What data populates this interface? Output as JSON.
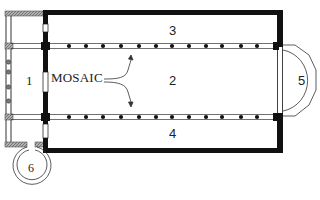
{
  "diagram": {
    "type": "architectural floor plan",
    "labels": {
      "narthex": "1",
      "nave": "2",
      "north_aisle": "3",
      "south_aisle": "4",
      "apse": "5",
      "baptistery": "6",
      "mosaic": "MOSAIC"
    },
    "colonnades": {
      "north_columns": 13,
      "south_columns": 13,
      "narthex_columns": 5
    },
    "colors": {
      "wall": "#111111",
      "hatched_wall": "#9a9a9a",
      "background": "#ffffff",
      "column": "#111111"
    }
  }
}
